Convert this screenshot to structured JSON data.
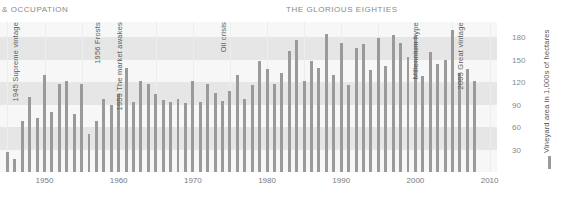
{
  "header": {
    "left_title": "& OCCUPATION",
    "center_title": "THE GLORIOUS EIGHTIES"
  },
  "legend": {
    "label": "Vineyard area in 1,000s of hectares",
    "swatch_color": "#9a9a9a"
  },
  "colors": {
    "bar": "#9a9a9a",
    "band_dark": "#e6e6e6",
    "band_light": "#f7f7f7",
    "text": "#6b6b6b",
    "axis_text": "#8a8a8a"
  },
  "chart_data": {
    "type": "bar",
    "title": "THE GLORIOUS EIGHTIES",
    "xlabel": "",
    "ylabel": "Vineyard area in 1,000s of hectares",
    "ylim": [
      0,
      200
    ],
    "xlim": [
      1944,
      2011
    ],
    "grid": true,
    "legend_position": "right",
    "ytick_labels": [
      "30",
      "60",
      "90",
      "120",
      "150",
      "180"
    ],
    "ytick_values": [
      30,
      60,
      90,
      120,
      150,
      180
    ],
    "xtick_labels": [
      "1950",
      "1960",
      "1970",
      "1980",
      "1990",
      "2000",
      "2010"
    ],
    "xtick_values": [
      1950,
      1960,
      1970,
      1980,
      1990,
      2000,
      2010
    ],
    "categories": [
      1945,
      1946,
      1947,
      1948,
      1949,
      1950,
      1951,
      1952,
      1953,
      1954,
      1955,
      1956,
      1957,
      1958,
      1959,
      1960,
      1961,
      1962,
      1963,
      1964,
      1965,
      1966,
      1967,
      1968,
      1969,
      1970,
      1971,
      1972,
      1973,
      1974,
      1975,
      1976,
      1977,
      1978,
      1979,
      1980,
      1981,
      1982,
      1983,
      1984,
      1985,
      1986,
      1987,
      1988,
      1989,
      1990,
      1991,
      1992,
      1993,
      1994,
      1995,
      1996,
      1997,
      1998,
      1999,
      2000,
      2001,
      2002,
      2003,
      2004,
      2005,
      2006,
      2007,
      2008
    ],
    "values": [
      27,
      18,
      68,
      100,
      72,
      130,
      80,
      118,
      122,
      78,
      118,
      51,
      68,
      98,
      90,
      104,
      139,
      94,
      121,
      118,
      104,
      96,
      94,
      98,
      92,
      122,
      94,
      118,
      106,
      95,
      108,
      130,
      98,
      116,
      148,
      138,
      118,
      132,
      161,
      176,
      122,
      148,
      139,
      184,
      129,
      172,
      116,
      166,
      171,
      136,
      179,
      142,
      183,
      172,
      153,
      182,
      128,
      160,
      144,
      149,
      189,
      132,
      138,
      122
    ],
    "annotations": [
      {
        "year": 1945,
        "text": "1945 Supreme vintage"
      },
      {
        "year": 1956,
        "text": "1956 Frosts"
      },
      {
        "year": 1959,
        "text": "1959 The market awakes"
      },
      {
        "year": 1973,
        "text": "Oil crisis"
      },
      {
        "year": 1999,
        "text": "Millennium hype"
      },
      {
        "year": 2005,
        "text": "2005 Great vintage"
      }
    ]
  }
}
